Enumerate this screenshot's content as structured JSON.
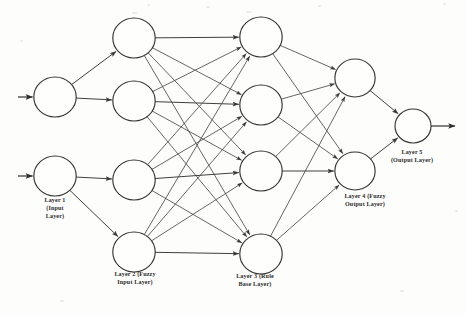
{
  "figure": {
    "background_color": "#fdfdfb",
    "line_color": "#4a4a48",
    "node_fill": "#fefefd",
    "node_stroke": "#343433",
    "text_color": "#2b2b2a"
  },
  "labels": {
    "layer1": "Layer 1\n(Input\nLayer)",
    "layer2": "Layer 2 (Fuzzy\nInput Layer)",
    "layer3": "Layer 3 (Rule\nBase Layer)",
    "layer4": "Layer 4 (Fuzzy\nOutput Layer)",
    "layer5": "Layer 5\n(Output Layer)"
  },
  "chart_data": {
    "type": "diagram",
    "diagram_kind": "feedforward-neural-network",
    "layers": [
      {
        "index": 1,
        "name": "Layer 1 (Input Layer)",
        "node_count": 2,
        "node_radius": 20,
        "nodes": [
          {
            "id": "L1N1",
            "cx": 55,
            "cy": 97
          },
          {
            "id": "L1N2",
            "cx": 55,
            "cy": 176
          }
        ]
      },
      {
        "index": 2,
        "name": "Layer 2 (Fuzzy Input Layer)",
        "node_count": 4,
        "node_radius": 20,
        "nodes": [
          {
            "id": "L2N1",
            "cx": 134,
            "cy": 38
          },
          {
            "id": "L2N2",
            "cx": 134,
            "cy": 101
          },
          {
            "id": "L2N3",
            "cx": 134,
            "cy": 180
          },
          {
            "id": "L2N4",
            "cx": 134,
            "cy": 252
          }
        ]
      },
      {
        "index": 3,
        "name": "Layer 3 (Rule Base Layer)",
        "node_count": 4,
        "node_radius": 20,
        "nodes": [
          {
            "id": "L3N1",
            "cx": 261,
            "cy": 37
          },
          {
            "id": "L3N2",
            "cx": 261,
            "cy": 105
          },
          {
            "id": "L3N3",
            "cx": 261,
            "cy": 171
          },
          {
            "id": "L3N4",
            "cx": 261,
            "cy": 254
          }
        ]
      },
      {
        "index": 4,
        "name": "Layer 4 (Fuzzy Output Layer)",
        "node_count": 2,
        "node_radius": 19,
        "nodes": [
          {
            "id": "L4N1",
            "cx": 355,
            "cy": 78
          },
          {
            "id": "L4N2",
            "cx": 355,
            "cy": 171
          }
        ]
      },
      {
        "index": 5,
        "name": "Layer 5 (Output Layer)",
        "node_count": 1,
        "node_radius": 17,
        "nodes": [
          {
            "id": "L5N1",
            "cx": 413,
            "cy": 126
          }
        ]
      }
    ],
    "external_inputs": [
      {
        "to": "L1N1",
        "from_x": 18,
        "y": 97
      },
      {
        "to": "L1N2",
        "from_x": 18,
        "y": 176
      }
    ],
    "external_outputs": [
      {
        "from": "L5N1",
        "to_x": 455,
        "y": 126
      }
    ],
    "connections": {
      "layer1_to_layer2": [
        [
          "L1N1",
          "L2N1"
        ],
        [
          "L1N1",
          "L2N2"
        ],
        [
          "L1N2",
          "L2N3"
        ],
        [
          "L1N2",
          "L2N4"
        ]
      ],
      "layer2_to_layer3": [
        [
          "L2N1",
          "L3N1"
        ],
        [
          "L2N1",
          "L3N2"
        ],
        [
          "L2N1",
          "L3N3"
        ],
        [
          "L2N1",
          "L3N4"
        ],
        [
          "L2N2",
          "L3N1"
        ],
        [
          "L2N2",
          "L3N2"
        ],
        [
          "L2N2",
          "L3N3"
        ],
        [
          "L2N2",
          "L3N4"
        ],
        [
          "L2N3",
          "L3N1"
        ],
        [
          "L2N3",
          "L3N2"
        ],
        [
          "L2N3",
          "L3N3"
        ],
        [
          "L2N3",
          "L3N4"
        ],
        [
          "L2N4",
          "L3N1"
        ],
        [
          "L2N4",
          "L3N2"
        ],
        [
          "L2N4",
          "L3N3"
        ],
        [
          "L2N4",
          "L3N4"
        ]
      ],
      "layer3_to_layer4": [
        [
          "L3N1",
          "L4N1"
        ],
        [
          "L3N1",
          "L4N2"
        ],
        [
          "L3N2",
          "L4N1"
        ],
        [
          "L3N2",
          "L4N2"
        ],
        [
          "L3N3",
          "L4N1"
        ],
        [
          "L3N3",
          "L4N2"
        ],
        [
          "L3N4",
          "L4N1"
        ],
        [
          "L3N4",
          "L4N2"
        ]
      ],
      "layer4_to_layer5": [
        [
          "L4N1",
          "L5N1"
        ],
        [
          "L4N2",
          "L5N1"
        ]
      ]
    },
    "label_positions": [
      {
        "layer": 1,
        "x": 22,
        "y": 196,
        "width": 66
      },
      {
        "layer": 2,
        "x": 96,
        "y": 270,
        "width": 78
      },
      {
        "layer": 3,
        "x": 216,
        "y": 272,
        "width": 78
      },
      {
        "layer": 4,
        "x": 325,
        "y": 192,
        "width": 80
      },
      {
        "layer": 5,
        "x": 372,
        "y": 148,
        "width": 80
      }
    ]
  }
}
